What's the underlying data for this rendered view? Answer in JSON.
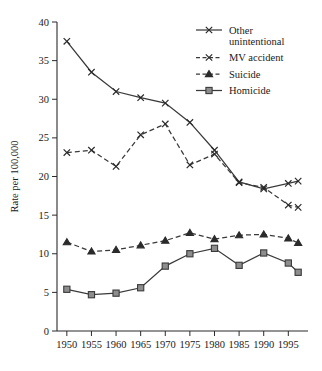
{
  "chart_data": {
    "type": "line",
    "title": "",
    "xlabel": "",
    "ylabel": "Rate per 100,000",
    "xlim": [
      1948,
      1999
    ],
    "ylim": [
      0,
      40
    ],
    "grid": false,
    "legend_position": "top-right",
    "x": [
      1950,
      1955,
      1960,
      1965,
      1970,
      1975,
      1980,
      1985,
      1990,
      1995,
      1997
    ],
    "xtick_labels": [
      "1950",
      "1955",
      "1960",
      "1965",
      "1970",
      "1975",
      "1980",
      "1985",
      "1990",
      "1995"
    ],
    "xtick_values": [
      1950,
      1955,
      1960,
      1965,
      1970,
      1975,
      1980,
      1985,
      1990,
      1995
    ],
    "ytick_labels": [
      "0",
      "5",
      "10",
      "15",
      "20",
      "25",
      "30",
      "35",
      "40"
    ],
    "ytick_values": [
      0,
      5,
      10,
      15,
      20,
      25,
      30,
      35,
      40
    ],
    "series": [
      {
        "name": "Other unintentional",
        "label_lines": [
          "Other",
          "unintentional"
        ],
        "marker": "x",
        "linestyle": "solid",
        "color": "#3a3a3a",
        "values": [
          37.5,
          33.5,
          31.0,
          30.2,
          29.5,
          27.0,
          23.4,
          19.3,
          18.4,
          19.1,
          19.4
        ]
      },
      {
        "name": "MV accident",
        "label_lines": [
          "MV accident"
        ],
        "marker": "x",
        "linestyle": "dashed",
        "color": "#3a3a3a",
        "values": [
          23.1,
          23.4,
          21.3,
          25.4,
          26.8,
          21.5,
          22.9,
          19.2,
          18.6,
          16.3,
          16.0
        ]
      },
      {
        "name": "Suicide",
        "label_lines": [
          "Suicide"
        ],
        "marker": "triangle",
        "linestyle": "dashed",
        "color": "#2b2b2b",
        "values": [
          11.5,
          10.3,
          10.5,
          11.1,
          11.7,
          12.7,
          11.9,
          12.4,
          12.5,
          12.0,
          11.4
        ]
      },
      {
        "name": "Homicide",
        "label_lines": [
          "Homicide"
        ],
        "marker": "square",
        "linestyle": "solid",
        "color": "#8d8d8d",
        "values": [
          5.4,
          4.7,
          4.9,
          5.6,
          8.4,
          10.0,
          10.7,
          8.5,
          10.1,
          8.8,
          7.6
        ]
      }
    ]
  },
  "figure": {
    "background_color": "#ffffff",
    "axis_color": "#2b2b2b"
  }
}
